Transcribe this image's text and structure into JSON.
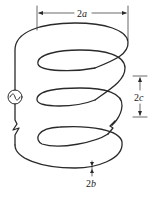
{
  "diagram": {
    "type": "helical-coil",
    "turns": 3,
    "source": {
      "symbol": "~",
      "kind": "ac-voltage-source"
    },
    "dimensions": {
      "diameter": {
        "coef": "2",
        "var": "a"
      },
      "pitch": {
        "coef": "2",
        "var": "c"
      },
      "wire_thickness": {
        "coef": "2",
        "var": "b"
      }
    },
    "colors": {
      "line": "#2a2a2a",
      "background": "#ffffff"
    }
  }
}
